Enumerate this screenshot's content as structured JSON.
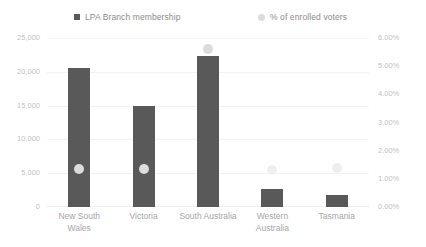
{
  "legend": {
    "items": [
      {
        "label": "LPA Branch membership",
        "marker": "square-marker-icon",
        "color": "#595959"
      },
      {
        "label": "% of enrolled voters",
        "marker": "circle-marker-icon",
        "color": "#DCDCDC"
      }
    ]
  },
  "axes": {
    "left_ticks": [
      "25,000",
      "20,000",
      "15,000",
      "10,000",
      "5,000",
      "0"
    ],
    "right_ticks": [
      "6.00%",
      "5.00%",
      "4.00%",
      "3.00%",
      "2.00%",
      "1.00%",
      "0.00%"
    ]
  },
  "chart_data": {
    "type": "bar",
    "title": "",
    "xlabel": "",
    "ylabel": "",
    "categories": [
      "New South Wales",
      "Victoria",
      "South Australia",
      "Western Australia",
      "Tasmania"
    ],
    "series": [
      {
        "name": "LPA Branch membership",
        "type": "bar",
        "axis": "left",
        "color": "#595959",
        "values": [
          20500,
          15000,
          22400,
          2600,
          1800
        ]
      },
      {
        "name": "% of enrolled voters",
        "type": "scatter",
        "axis": "right",
        "color": "#DCDCDC",
        "values": [
          1.35,
          1.35,
          5.6,
          1.3,
          1.4
        ]
      }
    ],
    "ylim": [
      0,
      25000
    ],
    "y2lim": [
      0,
      6
    ],
    "yticks": [
      0,
      5000,
      10000,
      15000,
      20000,
      25000
    ],
    "y2ticks": [
      0,
      1,
      2,
      3,
      4,
      5,
      6
    ],
    "grid": true,
    "legend_position": "top"
  }
}
